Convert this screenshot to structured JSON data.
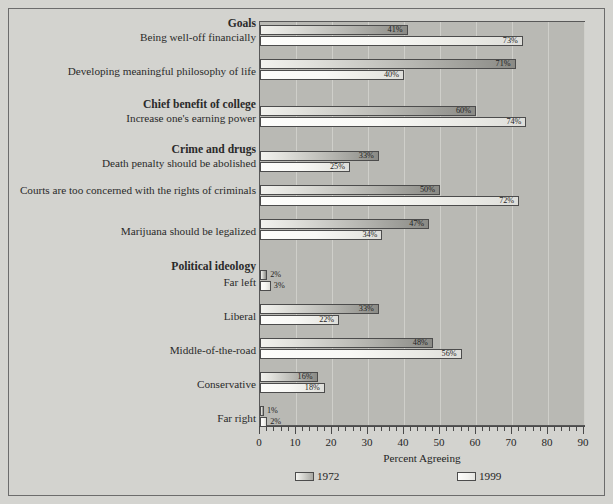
{
  "chart_data": {
    "type": "bar",
    "orientation": "horizontal",
    "title": "",
    "xlabel": "Percent Agreeing",
    "ylabel": "",
    "xlim": [
      0,
      90
    ],
    "xticks": [
      0,
      10,
      20,
      30,
      40,
      50,
      60,
      70,
      80,
      90
    ],
    "xtick_labels": [
      "0",
      "10",
      "20",
      "30",
      "40",
      "50",
      "60",
      "70",
      "80",
      "90"
    ],
    "grid": "vertical",
    "legend_position": "bottom",
    "legend": [
      "1972",
      "1999"
    ],
    "series": [
      {
        "name": "1972",
        "color": "#b4b4af",
        "values": [
          41,
          71,
          60,
          33,
          50,
          47,
          2,
          33,
          48,
          16,
          1
        ]
      },
      {
        "name": "1999",
        "color": "#f6f6f3",
        "values": [
          73,
          40,
          74,
          25,
          72,
          34,
          3,
          22,
          56,
          18,
          2
        ]
      }
    ],
    "categories": [
      "Being well-off financially",
      "Developing meaningful philosophy of life",
      "Increase one's earning power",
      "Death penalty should be abolished",
      "Courts are too concerned with the rights of criminals",
      "Marijuana should be legalized",
      "Far left",
      "Liberal",
      "Middle-of-the-road",
      "Conservative",
      "Far right"
    ],
    "section_headers": [
      "Goals",
      "Chief benefit of college",
      "Crime and drugs",
      "Political ideology"
    ],
    "data_labels_1972": [
      "41%",
      "71%",
      "60%",
      "33%",
      "50%",
      "47%",
      "2%",
      "33%",
      "48%",
      "16%",
      "1%"
    ],
    "data_labels_1999": [
      "73%",
      "40%",
      "74%",
      "25%",
      "72%",
      "34%",
      "3%",
      "22%",
      "56%",
      "18%",
      "2%"
    ]
  },
  "labels": [
    {
      "text": "Goals",
      "top": 0,
      "header": true,
      "two": false
    },
    {
      "text": "Being well-off financially",
      "top": 13,
      "header": false,
      "two": false
    },
    {
      "text": "Developing meaningful philosophy of life",
      "top": 47,
      "header": false,
      "two": false
    },
    {
      "text": "Chief benefit of college",
      "top": 81,
      "header": true,
      "two": false
    },
    {
      "text": "Increase one's earning power",
      "top": 94,
      "header": false,
      "two": false
    },
    {
      "text": "Crime and drugs",
      "top": 126,
      "header": true,
      "two": false
    },
    {
      "text": "Death penalty should be abolished",
      "top": 139,
      "header": false,
      "two": false
    },
    {
      "text": "Courts are too concerned with the rights of criminals",
      "top": 166,
      "header": false,
      "two": true
    },
    {
      "text": "Marijuana should be legalized",
      "top": 207,
      "header": false,
      "two": false
    },
    {
      "text": "Political ideology",
      "top": 243,
      "header": true,
      "two": false
    },
    {
      "text": "Far left",
      "top": 258,
      "header": false,
      "two": false
    },
    {
      "text": "Liberal",
      "top": 292,
      "header": false,
      "two": false
    },
    {
      "text": "Middle-of-the-road",
      "top": 326,
      "header": false,
      "two": false
    },
    {
      "text": "Conservative",
      "top": 360,
      "header": false,
      "two": false
    },
    {
      "text": "Far right",
      "top": 394,
      "header": false,
      "two": false
    }
  ],
  "groups": [
    {
      "name": "being-well-off-financially",
      "top": 3,
      "v1972": 41,
      "v1999": 73,
      "l1972": "41%",
      "l1999": "73%"
    },
    {
      "name": "developing-philosophy-of-life",
      "top": 37,
      "v1972": 71,
      "v1999": 40,
      "l1972": "71%",
      "l1999": "40%"
    },
    {
      "name": "increase-earning-power",
      "top": 84,
      "v1972": 60,
      "v1999": 74,
      "l1972": "60%",
      "l1999": "74%"
    },
    {
      "name": "death-penalty-abolished",
      "top": 129,
      "v1972": 33,
      "v1999": 25,
      "l1972": "33%",
      "l1999": "25%"
    },
    {
      "name": "courts-rights-of-criminals",
      "top": 163,
      "v1972": 50,
      "v1999": 72,
      "l1972": "50%",
      "l1999": "72%"
    },
    {
      "name": "marijuana-legalized",
      "top": 197,
      "v1972": 47,
      "v1999": 34,
      "l1972": "47%",
      "l1999": "34%"
    },
    {
      "name": "far-left",
      "top": 248,
      "v1972": 2,
      "v1999": 3,
      "l1972": "2%",
      "l1999": "3%"
    },
    {
      "name": "liberal",
      "top": 282,
      "v1972": 33,
      "v1999": 22,
      "l1972": "33%",
      "l1999": "22%"
    },
    {
      "name": "middle-of-the-road",
      "top": 316,
      "v1972": 48,
      "v1999": 56,
      "l1972": "48%",
      "l1999": "56%"
    },
    {
      "name": "conservative",
      "top": 350,
      "v1972": 16,
      "v1999": 18,
      "l1972": "16%",
      "l1999": "18%"
    },
    {
      "name": "far-right",
      "top": 384,
      "v1972": 1,
      "v1999": 2,
      "l1972": "1%",
      "l1999": "2%"
    }
  ],
  "axis": {
    "title": "Percent Agreeing",
    "ticks": [
      "0",
      "10",
      "20",
      "30",
      "40",
      "50",
      "60",
      "70",
      "80",
      "90"
    ]
  },
  "legend": {
    "items": [
      {
        "label": "1972",
        "key": "y1972",
        "left": 36
      },
      {
        "label": "1999",
        "key": "y1999",
        "left": 198
      }
    ]
  }
}
